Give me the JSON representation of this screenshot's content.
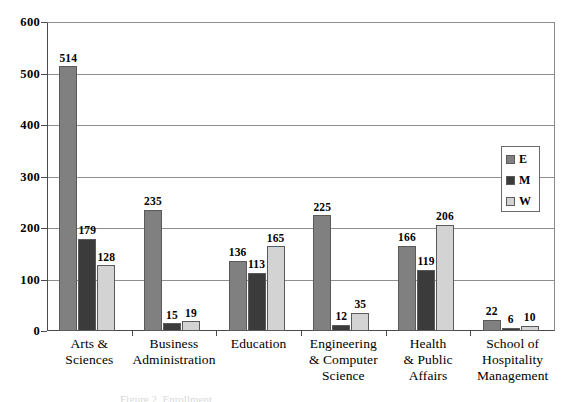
{
  "chart_data": {
    "type": "bar",
    "title": "",
    "xlabel": "",
    "ylabel": "",
    "ylim": [
      0,
      600
    ],
    "yticks": [
      0,
      100,
      200,
      300,
      400,
      500,
      600
    ],
    "grid": true,
    "legend_position": "right-inside",
    "categories": [
      "Arts &\nSciences",
      "Business\nAdministration",
      "Education",
      "Engineering\n& Computer\nScience",
      "Health\n& Public\nAffairs",
      "School of\nHospitality\nManagement"
    ],
    "series": [
      {
        "name": "E",
        "color": "#808080",
        "values": [
          514,
          235,
          136,
          225,
          166,
          22
        ]
      },
      {
        "name": "M",
        "color": "#3b3b3b",
        "values": [
          179,
          15,
          113,
          12,
          119,
          6
        ]
      },
      {
        "name": "W",
        "color": "#d3d3d3",
        "values": [
          128,
          19,
          165,
          35,
          206,
          10
        ]
      }
    ]
  },
  "axis": {
    "y_tick_labels": [
      "600",
      "500",
      "400",
      "300",
      "200",
      "100",
      "0"
    ]
  },
  "categories": [
    {
      "lines": [
        "Arts &",
        "Sciences"
      ]
    },
    {
      "lines": [
        "Business",
        "Administration"
      ]
    },
    {
      "lines": [
        "Education"
      ]
    },
    {
      "lines": [
        "Engineering",
        "& Computer",
        "Science"
      ]
    },
    {
      "lines": [
        "Health",
        "& Public",
        "Affairs"
      ]
    },
    {
      "lines": [
        "School of",
        "Hospitality",
        "Management"
      ]
    }
  ],
  "legend": {
    "items": [
      {
        "label": "E",
        "color": "#808080"
      },
      {
        "label": "M",
        "color": "#3b3b3b"
      },
      {
        "label": "W",
        "color": "#d3d3d3"
      }
    ]
  },
  "caption": {
    "text": "Figure 2. Enrollment"
  }
}
